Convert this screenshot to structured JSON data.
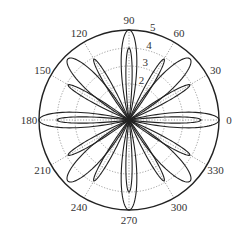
{
  "chart_data": {
    "type": "polar",
    "title": "",
    "center_px": [
      129,
      120
    ],
    "outer_radius_px": 90,
    "r_max": 5,
    "radial_ticks": [
      1,
      2,
      3,
      4,
      5
    ],
    "radial_tick_labels": [
      "2",
      "3",
      "4",
      "5"
    ],
    "angular_ticks_deg": [
      0,
      30,
      60,
      90,
      120,
      150,
      180,
      210,
      240,
      270,
      300,
      330
    ],
    "angular_tick_labels": [
      "0",
      "30",
      "60",
      "90",
      "120",
      "150",
      "180",
      "210",
      "240",
      "270",
      "300",
      "330"
    ],
    "grid": {
      "circles": "dotted",
      "spokes": "dotted"
    },
    "series": [
      {
        "name": "axis-petals-outer",
        "directions_deg": [
          0,
          90,
          180,
          270
        ],
        "r_peak": 5,
        "half_width_deg": 14
      },
      {
        "name": "axis-petals-inner",
        "directions_deg": [
          0,
          90,
          180,
          270
        ],
        "r_peak": 4,
        "half_width_deg": 7
      },
      {
        "name": "diagonal-petals",
        "directions_deg": [
          45,
          135,
          225,
          315
        ],
        "r_peak": 4.8,
        "half_width_deg": 16
      },
      {
        "name": "thirty-petals",
        "directions_deg": [
          30,
          60,
          120,
          150,
          210,
          240,
          300,
          330
        ],
        "r_peak": 3.9,
        "half_width_deg": 7
      }
    ],
    "line_color": "#222222",
    "grid_color": "#777777"
  },
  "labels": {
    "angles": [
      "0",
      "30",
      "60",
      "90",
      "120",
      "150",
      "180",
      "210",
      "240",
      "270",
      "300",
      "330"
    ],
    "radii": [
      "2",
      "3",
      "4",
      "5"
    ]
  }
}
